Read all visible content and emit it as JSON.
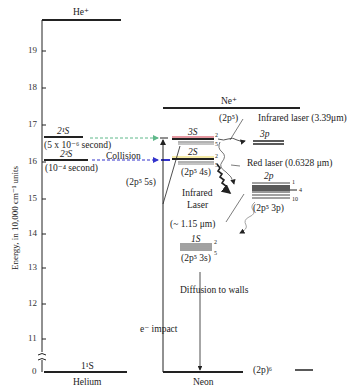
{
  "axis": {
    "label": "Energy, in 10,000 cm⁻¹ units",
    "ticks": [
      "19",
      "18",
      "17",
      "16",
      "15",
      "14",
      "13",
      "12",
      "11",
      "0"
    ]
  },
  "helium": {
    "column_label": "Helium",
    "ion_label": "He⁺",
    "level_21S": "2¹S",
    "level_21S_lifetime": "(5 x 10⁻⁶ second)",
    "level_23S": "2³S",
    "level_23S_lifetime": "(10⁻⁴ second)",
    "ground_label": "1¹S",
    "collision_label": "Collision"
  },
  "neon": {
    "column_label": "Neon",
    "ion_label": "Ne⁺",
    "ion_config": "(2p⁵)",
    "level_3S": "3S",
    "level_3S_config": "(2p⁵ 5s)",
    "level_2S": "2S",
    "level_2S_config": "(2p⁵ 4s)",
    "level_3p": "3p",
    "level_2p": "2p",
    "level_2p_config": "(2p⁵ 3p)",
    "level_1S": "1S",
    "level_1S_config": "(2p⁵ 3s)",
    "ground_config": "(2p)⁶",
    "sublevel_top": "2",
    "sublevel_bottom": "5",
    "sublevel_2p_1": "1",
    "sublevel_2p_4": "4",
    "sublevel_2p_10": "10",
    "e_impact": "e⁻ impact",
    "diffusion": "Diffusion to walls"
  },
  "transitions": {
    "infrared_339": "Infrared laser (3.39μm)",
    "red_laser": "Red laser (0.6328 μm)",
    "infrared_115_line1": "Infrared",
    "infrared_115_line2": "Laser",
    "infrared_115_wl": "(~ 1.15 μm)"
  },
  "colors": {
    "line": "#1a1a1a",
    "green_arrow": "#5fb88a",
    "blue_arrow": "#3333cc",
    "red_mark": "#cc3344",
    "yellow_mark": "#e8d44a"
  }
}
